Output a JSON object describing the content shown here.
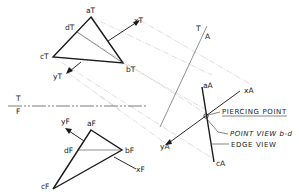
{
  "figure": {
    "top_view": {
      "vertices": {
        "a": "aT",
        "b": "bT",
        "c": "cT",
        "d": "dT"
      },
      "line_ends": {
        "x": "xT",
        "y": "yT"
      }
    },
    "front_view": {
      "vertices": {
        "a": "aF",
        "b": "bF",
        "c": "cF",
        "d": "dF"
      },
      "line_ends": {
        "x": "xF",
        "y": "yF"
      }
    },
    "fold_lines": {
      "tf": {
        "upper": "T",
        "lower": "F"
      },
      "ta": {
        "upper": "T",
        "lower": "A"
      }
    },
    "auxiliary_view": {
      "vertices": {
        "a": "aA",
        "c": "cA"
      },
      "line_ends": {
        "x": "xA",
        "y": "yA"
      }
    },
    "callouts": {
      "piercing_point": "PIERCING POINT",
      "point_view": "POINT VIEW b-d",
      "edge_view": "EDGE VIEW"
    }
  }
}
